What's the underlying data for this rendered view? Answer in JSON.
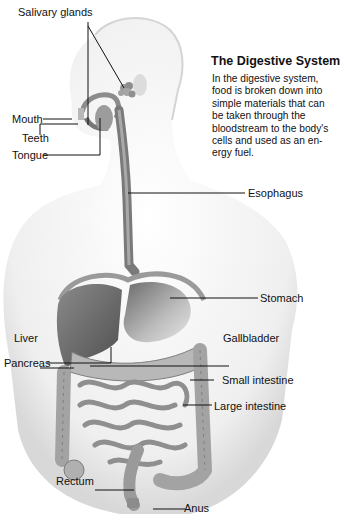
{
  "diagram": {
    "title": "The Digestive System",
    "description_lines": [
      "In the digestive system,",
      "food is broken down into",
      "simple materials that can",
      "be taken through the",
      "bloodstream to the body's",
      "cells and used as an en-",
      "ergy fuel."
    ],
    "labels": {
      "salivary_glands": "Salivary glands",
      "mouth": "Mouth",
      "teeth": "Teeth",
      "tongue": "Tongue",
      "esophagus": "Esophagus",
      "stomach": "Stomach",
      "liver": "Liver",
      "gallbladder": "Gallbladder",
      "pancreas": "Pancreas",
      "small_intestine": "Small intestine",
      "large_intestine": "Large intestine",
      "rectum": "Rectum",
      "anus": "Anus"
    },
    "colors": {
      "body_shade": "#e9e9e9",
      "organ_dark": "#6e6e6e",
      "organ_mid": "#9a9a9a",
      "organ_light": "#c8c8c8",
      "leader_line": "#111111"
    }
  }
}
